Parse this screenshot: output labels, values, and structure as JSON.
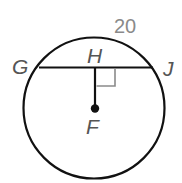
{
  "diagram": {
    "type": "circle-geometry",
    "points": {
      "G": {
        "label": "G"
      },
      "H": {
        "label": "H"
      },
      "J": {
        "label": "J"
      },
      "F": {
        "label": "F"
      }
    },
    "measurement_label": "20",
    "elements": [
      {
        "kind": "circle",
        "center": "F"
      },
      {
        "kind": "chord",
        "from": "G",
        "to": "J"
      },
      {
        "kind": "segment",
        "from": "H",
        "to": "F"
      },
      {
        "kind": "right-angle-marker",
        "at": "H"
      }
    ],
    "colors": {
      "stroke": "#111111",
      "marker": "#8a8a8a",
      "label": "#555555"
    }
  }
}
